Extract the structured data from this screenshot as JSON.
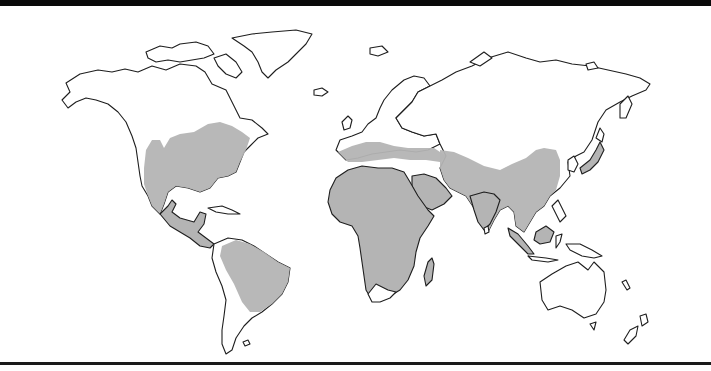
{
  "map": {
    "type": "world-distribution-map",
    "projection": "world outline",
    "colors": {
      "frame": "#0a0a0a",
      "land_fill": "#ffffff",
      "coastline": "#1e1e1e",
      "range_fill": "#b4b4b4",
      "background": "#ffffff"
    },
    "shaded_regions": [
      "central-eastern-north-america",
      "mexico-central-america",
      "south-america-north-east",
      "africa-except-south-tip",
      "madagascar",
      "southern-europe-mediterranean",
      "middle-east-arabia",
      "south-asia-india",
      "southeast-asia",
      "eastern-china-korea",
      "southern-japan",
      "borneo-indonesia"
    ],
    "unshaded_regions": [
      "canada-alaska",
      "greenland",
      "northern-europe",
      "russia-siberia",
      "central-asia",
      "southern-south-america",
      "southern-africa-tip",
      "australia",
      "new-zealand"
    ],
    "labels": []
  }
}
